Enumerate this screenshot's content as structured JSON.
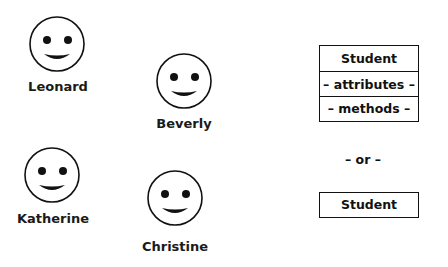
{
  "people": [
    {
      "name": "Leonard",
      "face": "smiley-face-icon"
    },
    {
      "name": "Beverly",
      "face": "smiley-face-icon"
    },
    {
      "name": "Katherine",
      "face": "smiley-face-icon"
    },
    {
      "name": "Christine",
      "face": "smiley-face-icon"
    }
  ],
  "uml_full": {
    "class_name": "Student",
    "attributes": "– attributes –",
    "methods": "– methods –"
  },
  "separator": "– or –",
  "uml_compact": {
    "class_name": "Student"
  }
}
